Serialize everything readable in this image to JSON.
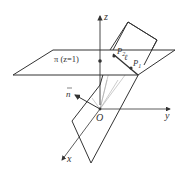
{
  "figure": {
    "axes": {
      "z": "z",
      "y": "y",
      "x": "x",
      "origin": "O"
    },
    "plane_label": "π (z=1)",
    "normal_label": "n",
    "points": {
      "p2": "P",
      "p2_sub": "2",
      "p1": "P",
      "p1_sub": "1"
    },
    "line_label": "ℓ",
    "colors": {
      "stroke": "#333333",
      "thin": "#999999"
    }
  }
}
